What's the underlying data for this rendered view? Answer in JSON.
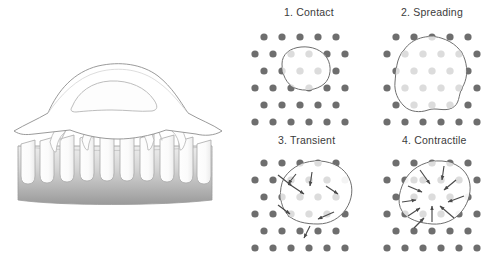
{
  "figure": {
    "title_visible": false,
    "background_color": "#ffffff",
    "width": 496,
    "height": 258
  },
  "left_illustration": {
    "name": "cell-on-micropost-array-side-view",
    "description_visible": false,
    "cell": {
      "fill_color": "#ffffff",
      "outline_color": "#8e8e8e",
      "nucleus_outline_color": "#b0b0b0",
      "nucleus_fill_color": "#fdfdfd"
    },
    "substrate": {
      "gradient_top_color": "#e9e9e9",
      "gradient_bottom_color": "#9a9a9a",
      "outline_color": "#9c9c9c",
      "post_count": 11,
      "post_fill_color": "#ffffff",
      "post_outline_color": "#a8a8a8"
    },
    "deflection_arrows": {
      "count": 5,
      "color": "#c4c4c4",
      "direction": "upward-inward"
    }
  },
  "panels": [
    {
      "id": "contact",
      "label": "1. Contact",
      "stage_number": "1",
      "stage_name": "Contact",
      "cell_outline_color": "#6f6f6f",
      "cell_fill_color": "#ffffff",
      "dot_inside_color": "#dcdcdc",
      "dot_outside_color": "#6e6e6e",
      "arrows": [],
      "arrow_count": 0,
      "cell_size_relative": "small"
    },
    {
      "id": "spreading",
      "label": "2. Spreading",
      "stage_number": "2",
      "stage_name": "Spreading",
      "cell_outline_color": "#6f6f6f",
      "cell_fill_color": "#ffffff",
      "dot_inside_color": "#dcdcdc",
      "dot_outside_color": "#6e6e6e",
      "arrows": [],
      "arrow_count": 0,
      "cell_size_relative": "large"
    },
    {
      "id": "transient",
      "label": "3. Transient",
      "stage_number": "3",
      "stage_name": "Transient",
      "cell_outline_color": "#6f6f6f",
      "cell_fill_color": "#ffffff",
      "dot_inside_color": "#dcdcdc",
      "dot_outside_color": "#6e6e6e",
      "arrow_color": "#4a4a4a",
      "arrow_count": 9,
      "arrow_pattern": "irregular-outward",
      "cell_size_relative": "large"
    },
    {
      "id": "contractile",
      "label": "4. Contractile",
      "stage_number": "4",
      "stage_name": "Contractile",
      "cell_outline_color": "#6f6f6f",
      "cell_fill_color": "#ffffff",
      "dot_inside_color": "#dcdcdc",
      "dot_outside_color": "#6e6e6e",
      "arrow_color": "#4a4a4a",
      "arrow_count": 11,
      "arrow_pattern": "converging-inward",
      "cell_size_relative": "large"
    }
  ],
  "lattice": {
    "description": "staggered hexagonal dot array of microposts viewed from above",
    "dot_radius": 3.6,
    "column_pitch": 18,
    "row_pitch": 17,
    "stagger_offset": 9
  }
}
